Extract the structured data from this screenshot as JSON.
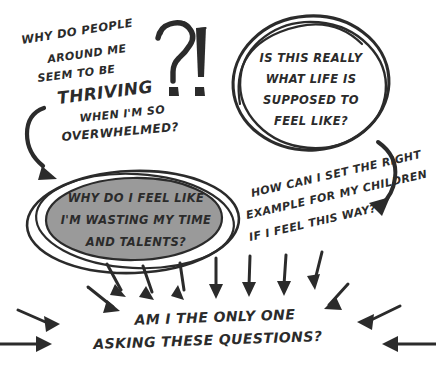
{
  "canvas": {
    "width": 436,
    "height": 377,
    "background": "#ffffff",
    "ink_color": "#2b2b2b",
    "ellipse_fill": "#9a9a9a"
  },
  "diagram": {
    "style": "hand-drawn-sketch",
    "title_marks": {
      "question_mark": "?",
      "exclamation_mark": "!"
    },
    "top_left_question": {
      "lines": [
        "WHY DO PEOPLE",
        "AROUND ME",
        "SEEM TO BE",
        "THRIVING",
        "WHEN I'M SO",
        "OVERWHELMED?"
      ],
      "emphasis_line": "THRIVING"
    },
    "circle_question": {
      "lines": [
        "IS THIS REALLY",
        "WHAT LIFE IS",
        "SUPPOSED TO",
        "FEEL LIKE?"
      ]
    },
    "ellipse_question": {
      "lines": [
        "WHY DO I FEEL LIKE",
        "I'M WASTING MY TIME",
        "AND TALENTS?"
      ]
    },
    "right_question": {
      "lines": [
        "HOW CAN I SET THE RIGHT",
        "EXAMPLE FOR MY CHILDREN",
        "IF I FEEL THIS WAY?"
      ]
    },
    "bottom_question": {
      "lines": [
        "AM I THE ONLY ONE",
        "ASKING THESE QUESTIONS?"
      ]
    }
  }
}
